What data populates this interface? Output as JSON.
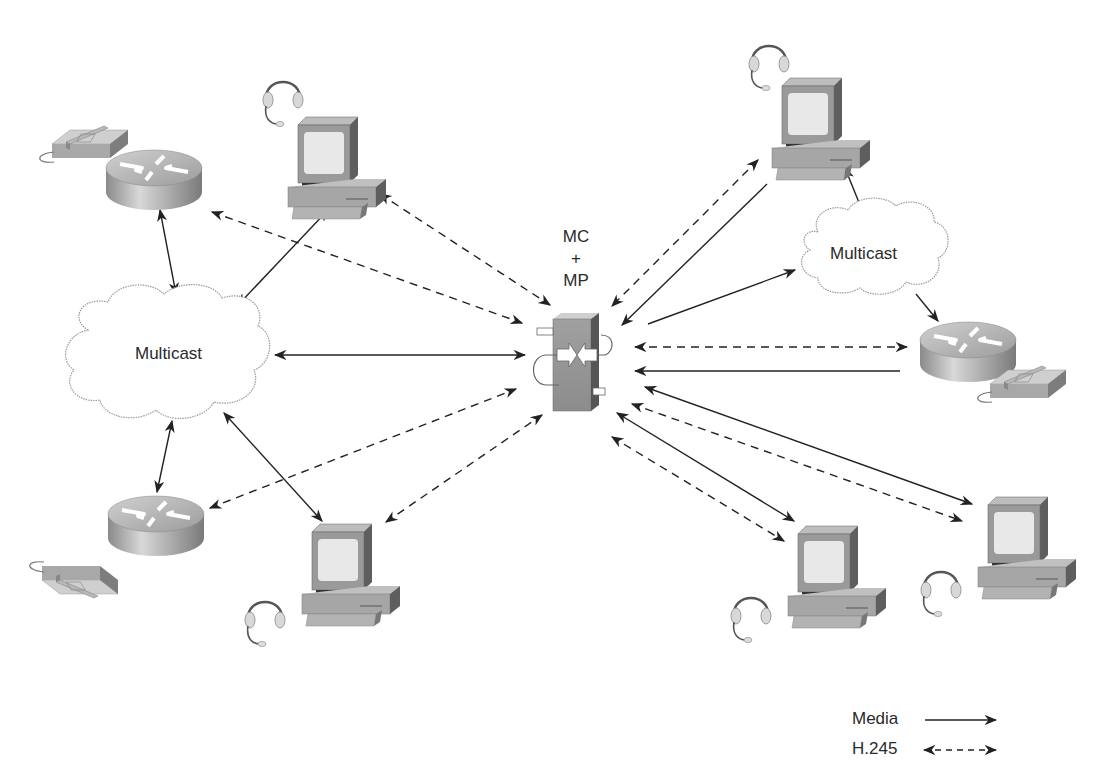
{
  "caption": {
    "text": "",
    "visible": false,
    "note_visible": "cut off at top edge"
  },
  "center_node": {
    "id": "mc-mp",
    "label_lines": [
      "MC",
      "+",
      "MP"
    ],
    "type": "multipoint-controller-and-processor"
  },
  "clouds": [
    {
      "id": "cloud-left",
      "label": "Multicast"
    },
    {
      "id": "cloud-right",
      "label": "Multicast"
    }
  ],
  "nodes": [
    {
      "id": "router-phone-top-left",
      "type": "router-with-phone"
    },
    {
      "id": "pc-top-left",
      "type": "pc-with-headset"
    },
    {
      "id": "router-phone-bottom-left",
      "type": "router-with-phone"
    },
    {
      "id": "pc-bottom-left",
      "type": "pc-with-headset"
    },
    {
      "id": "pc-top-right",
      "type": "pc-with-headset"
    },
    {
      "id": "router-phone-right",
      "type": "router-with-phone"
    },
    {
      "id": "pc-bottom-mid-right",
      "type": "pc-with-headset"
    },
    {
      "id": "pc-bottom-right",
      "type": "pc-with-headset"
    }
  ],
  "connections": [
    {
      "from": "router-phone-top-left",
      "to": "cloud-left",
      "kind": "media",
      "bidirectional": true
    },
    {
      "from": "pc-top-left",
      "to": "cloud-left",
      "kind": "media",
      "bidirectional": true
    },
    {
      "from": "router-phone-top-left",
      "to": "mc-mp",
      "kind": "h245",
      "bidirectional": true
    },
    {
      "from": "pc-top-left",
      "to": "mc-mp",
      "kind": "h245",
      "bidirectional": true
    },
    {
      "from": "cloud-left",
      "to": "mc-mp",
      "kind": "media",
      "bidirectional": true
    },
    {
      "from": "cloud-left",
      "to": "router-phone-bottom-left",
      "kind": "media",
      "bidirectional": true
    },
    {
      "from": "cloud-left",
      "to": "pc-bottom-left",
      "kind": "media",
      "bidirectional": true
    },
    {
      "from": "router-phone-bottom-left",
      "to": "mc-mp",
      "kind": "h245",
      "bidirectional": true
    },
    {
      "from": "pc-bottom-left",
      "to": "mc-mp",
      "kind": "h245",
      "bidirectional": true
    },
    {
      "from": "pc-top-right",
      "to": "mc-mp",
      "kind": "h245",
      "bidirectional": true
    },
    {
      "from": "pc-top-right",
      "to": "mc-mp",
      "kind": "media",
      "bidirectional": false
    },
    {
      "from": "mc-mp",
      "to": "cloud-right",
      "kind": "media",
      "bidirectional": false
    },
    {
      "from": "cloud-right",
      "to": "pc-top-right",
      "kind": "media",
      "bidirectional": false
    },
    {
      "from": "cloud-right",
      "to": "router-phone-right",
      "kind": "media",
      "bidirectional": false
    },
    {
      "from": "router-phone-right",
      "to": "mc-mp",
      "kind": "h245",
      "bidirectional": true
    },
    {
      "from": "router-phone-right",
      "to": "mc-mp",
      "kind": "media",
      "bidirectional": false
    },
    {
      "from": "mc-mp",
      "to": "pc-bottom-right",
      "kind": "media",
      "bidirectional": true
    },
    {
      "from": "mc-mp",
      "to": "pc-bottom-right",
      "kind": "h245",
      "bidirectional": true
    },
    {
      "from": "mc-mp",
      "to": "pc-bottom-mid-right",
      "kind": "media",
      "bidirectional": true
    },
    {
      "from": "mc-mp",
      "to": "pc-bottom-mid-right",
      "kind": "h245",
      "bidirectional": true
    }
  ],
  "legend": {
    "items": [
      {
        "label": "Media",
        "style": "solid-arrow"
      },
      {
        "label": "H.245",
        "style": "dashed-double-arrow"
      }
    ]
  },
  "colors": {
    "line": "#222222",
    "device_gray": "#a8a8a8",
    "device_dark": "#6e6e6e",
    "screen": "#e6e6e6",
    "cloud_stroke": "#9a9a9a"
  }
}
